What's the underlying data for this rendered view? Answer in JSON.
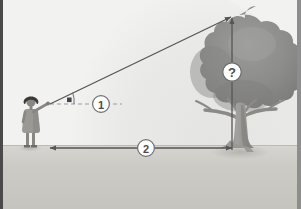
{
  "illustration": {
    "title": "Measuring tree height with angle of elevation",
    "width": 301,
    "height": 209
  },
  "labels": {
    "angle_label": "1",
    "distance_label": "2",
    "height_label": "?"
  },
  "annotations": {
    "angle_marker_name": "angle-of-elevation-marker",
    "sight_line_name": "line-of-sight",
    "height_arrow_name": "tree-height-arrow",
    "distance_arrow_name": "ground-distance-arrow",
    "dashed_reference_name": "horizontal-reference-line"
  },
  "figures": {
    "person": "observer-person",
    "tree": "tree"
  },
  "colors": {
    "sky": "#f2f2f0",
    "sky_arc": "#e6e6e4",
    "ground": "#c9c7c2",
    "ground_far": "#d5d3ce",
    "foliage": "#8e8e8c",
    "foliage_dark": "#7c7c7a",
    "foliage_light": "#a0a09e",
    "trunk": "#9a9894",
    "trunk_shadow": "#868480",
    "line": "#55565a",
    "dash": "#9b9b99",
    "circle_fill": "#ffffff",
    "circle_stroke": "#6e6f73",
    "label_text": "#4c4c4c",
    "person_skin": "#8a8682",
    "person_hair": "#3a3a38",
    "person_dress": "#9b9995",
    "border_left": "#4a4a4a",
    "border_right": "#8d8d8d",
    "shadow": "#b6b4af"
  }
}
